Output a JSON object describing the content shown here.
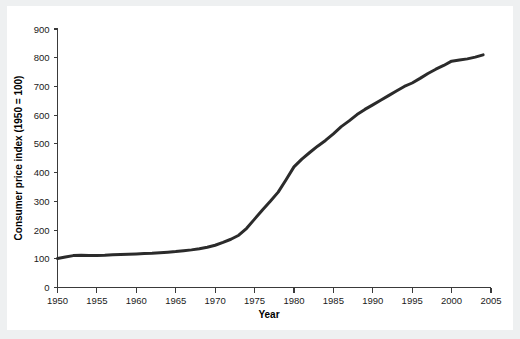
{
  "chart_data": {
    "type": "line",
    "title": "",
    "xlabel": "Year",
    "ylabel": "Consumer price index (1950 = 100)",
    "xlim": [
      1950,
      2005
    ],
    "ylim": [
      0,
      900
    ],
    "grid": false,
    "legend": null,
    "xticks": [
      1950,
      1955,
      1960,
      1965,
      1970,
      1975,
      1980,
      1985,
      1990,
      1995,
      2000,
      2005
    ],
    "yticks": [
      0,
      100,
      200,
      300,
      400,
      500,
      600,
      700,
      800,
      900
    ],
    "series": [
      {
        "name": "Consumer price index",
        "color": "#2b2b2b",
        "x": [
          1950,
          1951,
          1952,
          1953,
          1954,
          1955,
          1956,
          1957,
          1958,
          1959,
          1960,
          1961,
          1962,
          1963,
          1964,
          1965,
          1966,
          1967,
          1968,
          1969,
          1970,
          1971,
          1972,
          1973,
          1974,
          1975,
          1976,
          1977,
          1978,
          1979,
          1980,
          1981,
          1982,
          1983,
          1984,
          1985,
          1986,
          1987,
          1988,
          1989,
          1990,
          1991,
          1992,
          1993,
          1994,
          1995,
          1996,
          1997,
          1998,
          1999,
          2000,
          2001,
          2002,
          2003,
          2004
        ],
        "values": [
          101,
          106,
          111,
          112,
          111,
          111,
          112,
          114,
          115,
          116,
          117,
          118,
          119,
          121,
          123,
          125,
          128,
          131,
          135,
          140,
          147,
          157,
          168,
          182,
          206,
          238,
          270,
          300,
          332,
          375,
          420,
          447,
          470,
          492,
          512,
          535,
          560,
          580,
          602,
          620,
          636,
          652,
          668,
          684,
          700,
          712,
          728,
          745,
          760,
          773,
          788,
          792,
          796,
          802,
          810
        ]
      }
    ]
  }
}
